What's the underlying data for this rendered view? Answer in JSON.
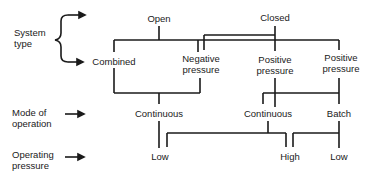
{
  "diagram": {
    "row_labels": {
      "system_type": [
        "System",
        "type"
      ],
      "mode_of_operation": [
        "Mode of",
        "operation"
      ],
      "operating_pressure": [
        "Operating",
        "pressure"
      ]
    },
    "nodes": {
      "open": "Open",
      "closed": "Closed",
      "combined": "Combined",
      "negative_pressure": [
        "Negative",
        "pressure"
      ],
      "positive_pressure_1": [
        "Positive",
        "pressure"
      ],
      "positive_pressure_2": [
        "Positive",
        "pressure"
      ],
      "continuous_1": "Continuous",
      "continuous_2": "Continuous",
      "batch": "Batch",
      "low_1": "Low",
      "high": "High",
      "low_2": "Low"
    },
    "line_color": "#1a1a1a"
  }
}
